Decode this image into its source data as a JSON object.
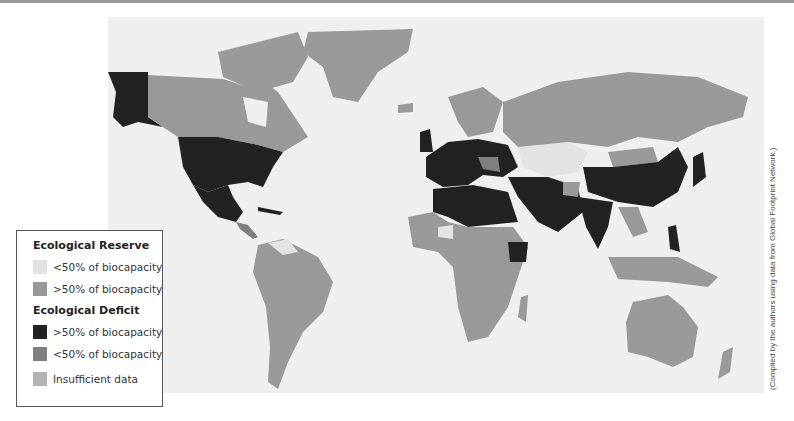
{
  "map": {
    "title": "World Ecological Reserve / Deficit",
    "colors": {
      "ocean": "#efefef",
      "reserve_low": "#e3e3e3",
      "reserve_high": "#999999",
      "deficit_high": "#222222",
      "deficit_low": "#7f7f7f",
      "insufficient": "#b3b3b3"
    }
  },
  "legend": {
    "reserve_title": "Ecological Reserve",
    "reserve_items": [
      {
        "label": "<50% of biocapacity",
        "color": "#e3e3e3"
      },
      {
        "label": ">50% of biocapacity",
        "color": "#999999"
      }
    ],
    "deficit_title": "Ecological Deficit",
    "deficit_items": [
      {
        "label": ">50% of biocapacity",
        "color": "#222222"
      },
      {
        "label": "<50% of biocapacity",
        "color": "#7f7f7f"
      }
    ],
    "insufficient": {
      "label": "Insufficient data",
      "color": "#b3b3b3"
    }
  },
  "caption": "(Compiled by the authors using data from Global Footprint Network.)"
}
